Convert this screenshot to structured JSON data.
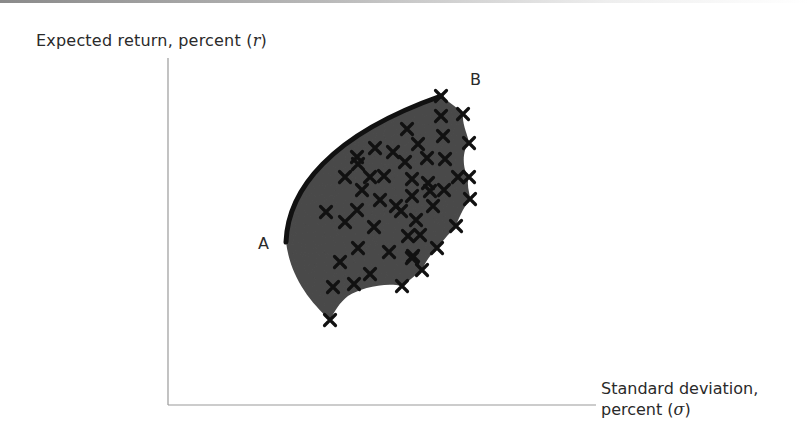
{
  "chart_data": {
    "type": "scatter",
    "title": "",
    "ylabel": "Expected return, percent (r)",
    "ylabel_parts": {
      "text": "Expected return, percent (",
      "var": "r",
      "close": ")"
    },
    "xlabel": "Standard deviation, percent (σ)",
    "xlabel_parts": {
      "line1": "Standard deviation,",
      "line2_text": "percent (",
      "var": "σ",
      "close": ")"
    },
    "annotations": [
      {
        "label": "A",
        "description": "minimum-variance point, start of efficient frontier"
      },
      {
        "label": "B",
        "description": "top of efficient frontier"
      }
    ],
    "region": "feasible set of portfolios (shaded dark gray)",
    "frontier": "efficient frontier highlighted as thick black curve from A to B",
    "axis_ticks": "none",
    "grid": false,
    "legend": "none",
    "marker": "x",
    "points_pixel": [
      [
        441,
        96
      ],
      [
        463,
        114
      ],
      [
        441,
        116
      ],
      [
        407,
        129
      ],
      [
        469,
        143
      ],
      [
        443,
        136
      ],
      [
        375,
        148
      ],
      [
        357,
        157
      ],
      [
        393,
        152
      ],
      [
        418,
        144
      ],
      [
        358,
        164
      ],
      [
        445,
        159
      ],
      [
        345,
        177
      ],
      [
        370,
        177
      ],
      [
        427,
        158
      ],
      [
        405,
        162
      ],
      [
        384,
        176
      ],
      [
        412,
        179
      ],
      [
        428,
        183
      ],
      [
        458,
        177
      ],
      [
        469,
        177
      ],
      [
        362,
        190
      ],
      [
        380,
        200
      ],
      [
        444,
        190
      ],
      [
        470,
        199
      ],
      [
        430,
        191
      ],
      [
        396,
        206
      ],
      [
        412,
        196
      ],
      [
        326,
        212
      ],
      [
        357,
        210
      ],
      [
        345,
        222
      ],
      [
        433,
        206
      ],
      [
        374,
        227
      ],
      [
        401,
        211
      ],
      [
        416,
        220
      ],
      [
        456,
        226
      ],
      [
        408,
        236
      ],
      [
        420,
        235
      ],
      [
        358,
        248
      ],
      [
        389,
        252
      ],
      [
        413,
        256
      ],
      [
        437,
        248
      ],
      [
        422,
        270
      ],
      [
        340,
        262
      ],
      [
        354,
        284
      ],
      [
        370,
        274
      ],
      [
        333,
        287
      ],
      [
        402,
        286
      ],
      [
        412,
        258
      ],
      [
        330,
        320
      ]
    ]
  },
  "labels": {
    "point_a": "A",
    "point_b": "B"
  },
  "colors": {
    "region_fill": "#4a4a4a",
    "frontier": "#111111",
    "marker": "#111111",
    "axis": "#9a9a9a",
    "text": "#2a2a2a"
  }
}
